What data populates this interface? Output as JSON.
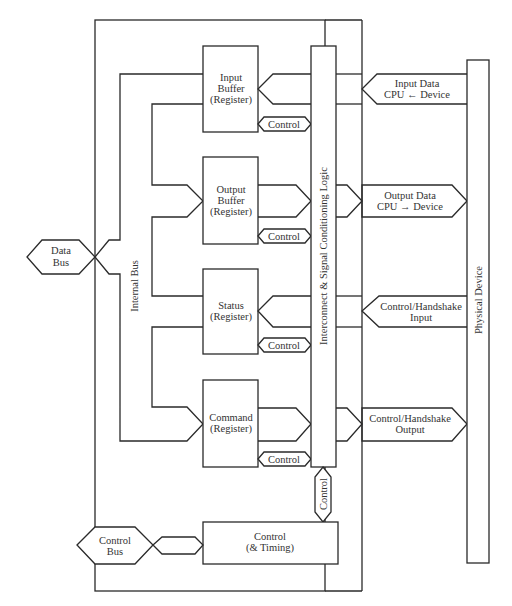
{
  "diagram": {
    "internal_bus_label": "Internal Bus",
    "interconnect_label": "Interconnect & Signal Conditioning Logic",
    "physical_device_label": "Physical Device",
    "data_bus": {
      "line1": "Data",
      "line2": "Bus"
    },
    "control_bus": {
      "line1": "Control",
      "line2": "Bus"
    },
    "control_timing": {
      "line1": "Control",
      "line2": "(& Timing)"
    },
    "vertical_control_label": "Control",
    "registers": [
      {
        "line1": "Input",
        "line2": "Buffer",
        "line3": "(Register)",
        "control_label": "Control"
      },
      {
        "line1": "Output",
        "line2": "Buffer",
        "line3": "(Register)",
        "control_label": "Control"
      },
      {
        "line1": "Status",
        "line2": "(Register)",
        "line3": "",
        "control_label": "Control"
      },
      {
        "line1": "Command",
        "line2": "(Register)",
        "line3": "",
        "control_label": "Control"
      }
    ],
    "device_signals": [
      {
        "line1": "Input Data",
        "line2": "CPU ← Device",
        "direction": "to-interconnect"
      },
      {
        "line1": "Output Data",
        "line2": "CPU → Device",
        "direction": "to-device"
      },
      {
        "line1": "Control/Handshake",
        "line2": "Input",
        "direction": "to-interconnect"
      },
      {
        "line1": "Control/Handshake",
        "line2": "Output",
        "direction": "to-device"
      }
    ]
  }
}
